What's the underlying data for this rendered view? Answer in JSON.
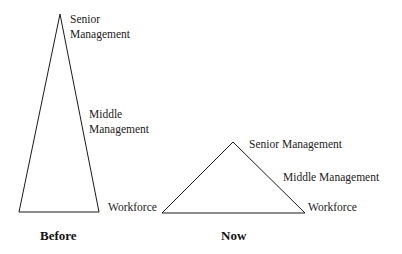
{
  "diagram": {
    "type": "organizational-pyramid-comparison",
    "line_color": "#1a1a1a",
    "before": {
      "title": "Before",
      "shape": "tall narrow triangle",
      "vertices": {
        "apex": [
          60,
          14
        ],
        "base_left": [
          19,
          212
        ],
        "base_right": [
          99,
          212
        ]
      },
      "labels": {
        "senior_line1": "Senior",
        "senior_line2": "Management",
        "middle_line1": "Middle",
        "middle_line2": "Management",
        "workforce": "Workforce"
      }
    },
    "now": {
      "title": "Now",
      "shape": "short wide triangle",
      "vertices": {
        "apex": [
          233,
          142
        ],
        "base_left": [
          162,
          213
        ],
        "base_right": [
          305,
          213
        ]
      },
      "labels": {
        "senior": "Senior Management",
        "middle": "Middle Management",
        "workforce": "Workforce"
      }
    }
  }
}
